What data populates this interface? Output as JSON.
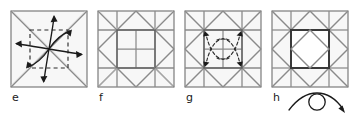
{
  "figure": {
    "type": "origami-instruction-sequence",
    "panel_count": 4,
    "background_color": "#ffffff",
    "paper_fill": "#f7f7f7",
    "crease_color": "#8a8a8a",
    "fold_edge_color": "#555555",
    "dark_line_color": "#3a3a3a",
    "arrow_color": "#1a1a1a",
    "dashed_color": "#2b2b2b",
    "label_color": "#1a1a1a"
  },
  "panels": [
    {
      "id": "e",
      "label": "e",
      "description": "Square with both diagonals creased, a dashed inner square, and four curved arrows spiraling outward from the center toward the edges",
      "has_dashed_square": true,
      "has_diagonals": true,
      "arrow_count": 4,
      "arrow_style": "solid-curved-outward"
    },
    {
      "id": "f",
      "label": "f",
      "description": "Square showing the completed three-by-three grid crease pattern with corner diagonals forming a star, and a subdivided central square",
      "has_dashed_square": false,
      "has_diagonals": true,
      "arrow_count": 0,
      "arrow_style": "none"
    },
    {
      "id": "g",
      "label": "g",
      "description": "Same grid pattern as panel f with four dashed curved arrows pointing inward toward the four inner corners of the central square",
      "has_dashed_square": false,
      "has_diagonals": true,
      "arrow_count": 4,
      "arrow_style": "dashed-curved-inward"
    },
    {
      "id": "h",
      "label": "h",
      "description": "Resulting shape: square with a bold outlined central square containing an inscribed diamond, surrounded by star points",
      "has_dashed_square": false,
      "has_diagonals": true,
      "arrow_count": 0,
      "arrow_style": "none"
    }
  ],
  "symbols": {
    "turn_over": {
      "name": "turn-over-symbol",
      "meaning": "turn the model over",
      "shape": "curved arrow looping around a circle",
      "attached_to_panel": "h"
    }
  }
}
